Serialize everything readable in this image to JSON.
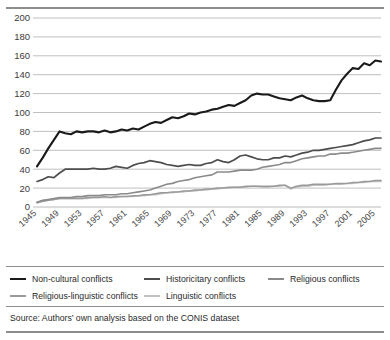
{
  "chart_data": {
    "type": "line",
    "title": "",
    "subtitle": "",
    "xlabel": "",
    "ylabel": "",
    "xlim": [
      1945,
      2006
    ],
    "ylim": [
      0,
      200
    ],
    "ytick_step": 20,
    "grid": true,
    "legend_position": "bottom",
    "yticks": [
      0,
      20,
      40,
      60,
      80,
      100,
      120,
      140,
      160,
      180,
      200
    ],
    "xticks": [
      1945,
      1949,
      1953,
      1957,
      1961,
      1965,
      1969,
      1973,
      1977,
      1981,
      1985,
      1989,
      1993,
      1997,
      2001,
      2005
    ],
    "x": [
      1945,
      1946,
      1947,
      1948,
      1949,
      1950,
      1951,
      1952,
      1953,
      1954,
      1955,
      1956,
      1957,
      1958,
      1959,
      1960,
      1961,
      1962,
      1963,
      1964,
      1965,
      1966,
      1967,
      1968,
      1969,
      1970,
      1971,
      1972,
      1973,
      1974,
      1975,
      1976,
      1977,
      1978,
      1979,
      1980,
      1981,
      1982,
      1983,
      1984,
      1985,
      1986,
      1987,
      1988,
      1989,
      1990,
      1991,
      1992,
      1993,
      1994,
      1995,
      1996,
      1997,
      1998,
      1999,
      2000,
      2001,
      2002,
      2003,
      2004,
      2005,
      2006
    ],
    "series": [
      {
        "name": "Non-cultural conflicts",
        "color": "#1a1a1a",
        "width": 2.1,
        "values": [
          43,
          52,
          62,
          71,
          80,
          78,
          77,
          80,
          79,
          80,
          80,
          79,
          81,
          79,
          80,
          82,
          81,
          83,
          82,
          85,
          88,
          90,
          89,
          92,
          95,
          94,
          96,
          99,
          98,
          100,
          101,
          103,
          104,
          106,
          108,
          107,
          110,
          113,
          118,
          120,
          119,
          119,
          117,
          115,
          114,
          113,
          116,
          118,
          115,
          113,
          112,
          112,
          113,
          124,
          134,
          141,
          147,
          146,
          152,
          150,
          155,
          154
        ]
      },
      {
        "name": "Historicitary conflicts",
        "color": "#4d4d4d",
        "width": 1.7,
        "values": [
          27,
          29,
          32,
          31,
          36,
          40,
          40,
          40,
          40,
          40,
          41,
          40,
          40,
          41,
          43,
          42,
          41,
          44,
          46,
          47,
          49,
          48,
          47,
          45,
          44,
          43,
          44,
          45,
          44,
          44,
          46,
          47,
          50,
          48,
          47,
          50,
          54,
          55,
          53,
          51,
          50,
          50,
          52,
          52,
          54,
          53,
          55,
          57,
          58,
          60,
          60,
          61,
          62,
          63,
          64,
          65,
          66,
          68,
          70,
          71,
          73,
          73
        ]
      },
      {
        "name": "Religious conflicts",
        "color": "#8a8a8a",
        "width": 1.6,
        "values": [
          5,
          7,
          8,
          9,
          10,
          10,
          10,
          11,
          11,
          12,
          12,
          12,
          13,
          13,
          13,
          14,
          14,
          15,
          16,
          17,
          18,
          20,
          22,
          24,
          25,
          27,
          28,
          29,
          31,
          32,
          33,
          34,
          37,
          37,
          37,
          38,
          39,
          39,
          39,
          40,
          42,
          43,
          44,
          45,
          47,
          47,
          49,
          51,
          52,
          53,
          54,
          54,
          56,
          56,
          57,
          57,
          58,
          59,
          60,
          61,
          62,
          62
        ]
      },
      {
        "name": "Religious-linguistic conflicts",
        "color": "#9a9a9a",
        "width": 1.5,
        "values": [
          5,
          6,
          7,
          8,
          9,
          9,
          9,
          9,
          9,
          10,
          10,
          10,
          11,
          10,
          11,
          11,
          11,
          12,
          12,
          13,
          13,
          14,
          15,
          15,
          16,
          16,
          17,
          17,
          18,
          18,
          19,
          19,
          20,
          20,
          21,
          21,
          21,
          22,
          22,
          22,
          22,
          22,
          22,
          23,
          23,
          20,
          22,
          23,
          23,
          24,
          24,
          24,
          24,
          25,
          25,
          25,
          26,
          26,
          27,
          27,
          28,
          28
        ]
      },
      {
        "name": "Linguistic conflicts",
        "color": "#c2c2c2",
        "width": 1.5,
        "values": [
          4,
          6,
          7,
          8,
          9,
          9,
          9,
          9,
          9,
          9,
          10,
          10,
          10,
          10,
          10,
          11,
          11,
          11,
          12,
          12,
          13,
          13,
          14,
          15,
          15,
          16,
          16,
          17,
          17,
          18,
          18,
          19,
          19,
          20,
          20,
          21,
          21,
          21,
          22,
          22,
          21,
          21,
          22,
          22,
          23,
          19,
          21,
          22,
          22,
          23,
          23,
          23,
          24,
          24,
          24,
          25,
          25,
          26,
          26,
          27,
          27,
          27
        ]
      }
    ]
  },
  "legend": {
    "items": [
      {
        "label": "Non-cultural conflicts",
        "color": "#1a1a1a"
      },
      {
        "label": "Historicitary conflicts",
        "color": "#4d4d4d"
      },
      {
        "label": "Religious conflicts",
        "color": "#8a8a8a"
      },
      {
        "label": "Religious-linguistic conflicts",
        "color": "#9a9a9a"
      },
      {
        "label": "Linguistic conflicts",
        "color": "#c2c2c2"
      }
    ]
  },
  "source": {
    "text": "Source: Authors’ own analysis based on the CONIS dataset"
  }
}
